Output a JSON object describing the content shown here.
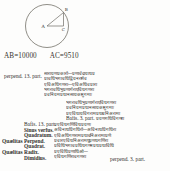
{
  "page": {
    "background_color": "#fdfdfc",
    "ink_color": "#2e2c29"
  },
  "diagram": {
    "name": "circle-with-inscribed-right-triangle",
    "center_label": "A",
    "upper_point_label": "B",
    "foot_point_label": "C",
    "stroke_color": "#6f6c66",
    "description_visible": false
  },
  "caption": {
    "segment_1": "AB=10000",
    "segment_2": "AC=9510"
  },
  "blocks": {
    "perpend_label": {
      "latin": [
        "perpend. 13. part."
      ],
      "script": [
        "सारायणप्रकारो—प्रणावेदायाधप्र",
        "प्रावधिभगावधिद्वियनरामेव",
        "एविअधिगणरा—एविअधिवप्रारा",
        "भगरावधिभुप्रणागेराएविधगणरा",
        "प्रवनियमप्रधानसायकानुगमाः"
      ]
    },
    "continuation": {
      "script": [
        "भगरावधिभुप्रणागेराएविधगणरा",
        "प्रवनियमप्रधानसायकानुगमाः",
        "प्रएविधायविगरामप्रधावनिअरामा",
        "प्रयणगधिविगणरा"
      ],
      "inline_latin": "Bafis. 3. part."
    },
    "table": {
      "left_column": [
        "Quælitas",
        "Quælitas"
      ],
      "terms": [
        "Bafis. 13. part.",
        "Sinus verfus.",
        "Quadratum.",
        "Perpend.",
        "Quadrat.",
        "Radix.",
        "Dimidius."
      ],
      "script": [
        "प्रएविधगणिविधप्रयणः",
        "अविनाधप्रिगधिरो—अविनाधप्रिगधिरा",
        "एविअधिगणरामप्रधावनिअरामाप्रणे",
        "प्रवारएविधनिअरामधुप्रणधगणिरा",
        "प्रविधिभगावप्रधिधगणनप्रधप्रधाविधि",
        "प्रएविधिप्रणाधिओ—",
        "एविधगणिरावगणरा"
      ],
      "tail_latin": "perpend. 3. part."
    }
  }
}
